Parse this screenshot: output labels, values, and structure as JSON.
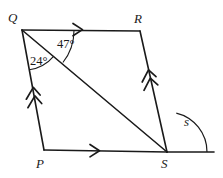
{
  "figure": {
    "stroke_color": "#1a1a1a",
    "background_color": "#ffffff",
    "vertices": [
      {
        "name": "Q",
        "label": "Q",
        "x": 22,
        "y": 30
      },
      {
        "name": "R",
        "label": "R",
        "x": 140,
        "y": 31
      },
      {
        "name": "S",
        "label": "S",
        "x": 167,
        "y": 152
      },
      {
        "name": "P",
        "label": "P",
        "x": 44,
        "y": 150
      }
    ],
    "extension": {
      "from": "S",
      "to_x": 214,
      "to_y": 152
    },
    "diagonal": {
      "from": "Q",
      "to": "S"
    },
    "angles": [
      {
        "name": "angle-RQS",
        "label": "47°",
        "vertex": "Q",
        "between": [
          "QR",
          "QS"
        ],
        "value": 47,
        "unit": "degrees"
      },
      {
        "name": "angle-SQP",
        "label": "24°",
        "vertex": "Q",
        "between": [
          "QS",
          "QP"
        ],
        "value": 24,
        "unit": "degrees"
      },
      {
        "name": "angle-s",
        "label": "s",
        "vertex": "S",
        "between": [
          "SR",
          "S-extension"
        ],
        "value": null,
        "unit": "unknown"
      }
    ],
    "side_markings": [
      {
        "name": "marking-QR",
        "side": "QR",
        "ticks": 1,
        "style": "arrowhead",
        "direction": "right"
      },
      {
        "name": "marking-PS",
        "side": "PS",
        "ticks": 1,
        "style": "arrowhead",
        "direction": "right"
      },
      {
        "name": "marking-QP",
        "side": "QP",
        "ticks": 2,
        "style": "arrowhead",
        "direction": "up"
      },
      {
        "name": "marking-RS",
        "side": "RS",
        "ticks": 2,
        "style": "arrowhead",
        "direction": "up"
      }
    ]
  }
}
